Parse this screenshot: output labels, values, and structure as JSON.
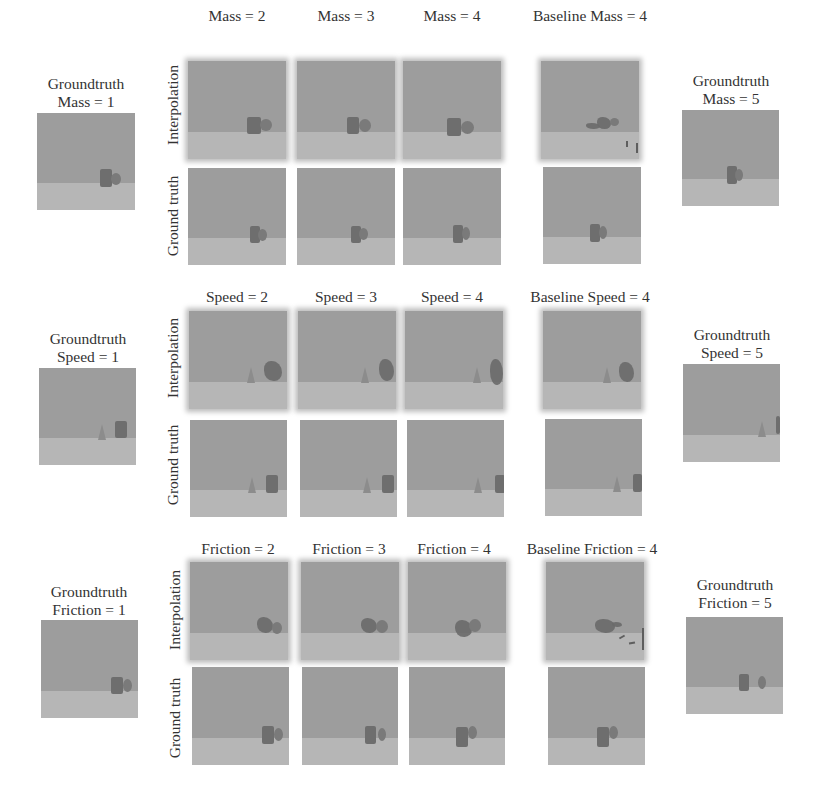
{
  "figure": {
    "row_labels": {
      "interpolation": "Interpolation",
      "ground_truth": "Ground truth"
    },
    "groups": [
      {
        "name": "mass",
        "left_gt_label": [
          "Groundtruth",
          "Mass = 1"
        ],
        "right_gt_label": [
          "Groundtruth",
          "Mass = 5"
        ],
        "column_labels": [
          "Mass = 2",
          "Mass = 3",
          "Mass = 4",
          "Baseline Mass = 4"
        ]
      },
      {
        "name": "speed",
        "left_gt_label": [
          "Groundtruth",
          "Speed = 1"
        ],
        "right_gt_label": [
          "Groundtruth",
          "Speed = 5"
        ],
        "column_labels": [
          "Speed = 2",
          "Speed = 3",
          "Speed = 4",
          "Baseline Speed = 4"
        ]
      },
      {
        "name": "friction",
        "left_gt_label": [
          "Groundtruth",
          "Friction = 1"
        ],
        "right_gt_label": [
          "Groundtruth",
          "Friction = 5"
        ],
        "column_labels": [
          "Friction = 2",
          "Friction = 3",
          "Friction = 4",
          "Baseline Friction = 4"
        ]
      }
    ],
    "colors": {
      "background": "#ffffff",
      "wall": "#9d9d9d",
      "floor": "#b6b6b6",
      "object": "#6e6e6e",
      "text": "#333333"
    }
  }
}
